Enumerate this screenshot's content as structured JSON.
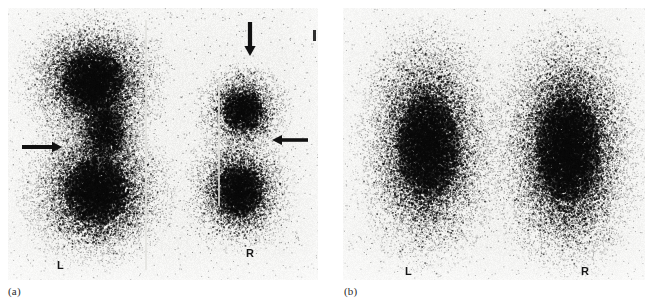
{
  "figure": {
    "type": "nuclear-medicine-scintigram",
    "modality": "lung perfusion scan",
    "background_color": "#ffffff",
    "film_color": "#f2f2f0",
    "dot_color": "#1a1a1a",
    "marker_color": "#111111"
  },
  "panels": [
    {
      "id": "a",
      "caption": "(a)",
      "caption_x": 8,
      "caption_y": 286,
      "rect": {
        "x": 8,
        "y": 8,
        "w": 310,
        "h": 272
      },
      "side_labels": [
        {
          "text": "L",
          "x": 57,
          "y": 260
        },
        {
          "text": "R",
          "x": 246,
          "y": 248
        }
      ],
      "markers": [
        {
          "name": "arrow-down-marker",
          "direction": "down",
          "x": 243,
          "y": 22,
          "length": 34
        },
        {
          "name": "arrow-right-marker",
          "direction": "right",
          "x": 22,
          "y": 140,
          "length": 40
        },
        {
          "name": "arrow-left-marker",
          "direction": "left",
          "x": 272,
          "y": 133,
          "length": 36
        }
      ],
      "tick": {
        "x": 313,
        "y": 30,
        "w": 3,
        "h": 11
      },
      "streaks": [
        {
          "x": 145,
          "y": 20,
          "w": 2,
          "h": 250
        },
        {
          "x": 218,
          "y": 78,
          "w": 2,
          "h": 128
        }
      ]
    },
    {
      "id": "b",
      "caption": "(b)",
      "caption_x": 344,
      "caption_y": 286,
      "rect": {
        "x": 343,
        "y": 8,
        "w": 302,
        "h": 272
      },
      "side_labels": [
        {
          "text": "L",
          "x": 405,
          "y": 266
        },
        {
          "text": "R",
          "x": 581,
          "y": 266
        }
      ],
      "markers": [],
      "tick": null,
      "streaks": []
    }
  ],
  "chart_data": {
    "type": "scatter",
    "xlabel": "",
    "ylabel": "",
    "panel_a": {
      "label": "(a)",
      "description": "Perfusion scan showing large dense left lung and smaller right lung with perfusion defects indicated by arrows",
      "blobs": [
        {
          "name": "left-lung-upper",
          "cx": 92,
          "cy": 80,
          "rx": 56,
          "ry": 52,
          "density": 0.95
        },
        {
          "name": "left-lung-lower",
          "cx": 96,
          "cy": 190,
          "rx": 58,
          "ry": 58,
          "density": 0.92
        },
        {
          "name": "left-hilum-core",
          "cx": 104,
          "cy": 130,
          "rx": 34,
          "ry": 44,
          "density": 0.7
        },
        {
          "name": "right-lung-upper",
          "cx": 242,
          "cy": 110,
          "rx": 36,
          "ry": 36,
          "density": 0.85
        },
        {
          "name": "right-lung-lower",
          "cx": 238,
          "cy": 190,
          "rx": 42,
          "ry": 46,
          "density": 0.88
        }
      ]
    },
    "panel_b": {
      "label": "(b)",
      "description": "Follow-up perfusion scan showing symmetric, largely uniform uptake in both lungs",
      "blobs": [
        {
          "name": "left-lung",
          "cx": 427,
          "cy": 145,
          "rx": 56,
          "ry": 92,
          "density": 0.88
        },
        {
          "name": "right-lung",
          "cx": 567,
          "cy": 148,
          "rx": 58,
          "ry": 96,
          "density": 0.92
        }
      ]
    }
  }
}
